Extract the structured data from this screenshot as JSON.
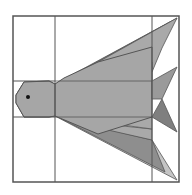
{
  "diagram": {
    "type": "origami-crease-pattern",
    "width": 192,
    "height": 195,
    "colors": {
      "background": "#ffffff",
      "line": "#555555",
      "body": "#a6a6a6",
      "fin_light": "#c4c4c4",
      "fin_mid": "#a9a9a9",
      "fin_dark": "#8e8e8e",
      "tail": "#9a9a9a",
      "tail_dark": "#7f7f7f",
      "eye": "#111111"
    },
    "frame": {
      "x": 13,
      "y": 16,
      "size": 166
    },
    "grid_lines": {
      "vertical": [
        55,
        152
      ],
      "horizontal": [
        81,
        117
      ]
    },
    "body": {
      "points": "16,95 24,82 49,81 55,84 64,78 98,62 152,47 152,117 98,134 55,116 49,117 24,117 16,103"
    },
    "head": {
      "points": "16,95 24,82 49,81 55,84 55,116 49,117 24,117 16,103"
    },
    "eye": {
      "cx": 28,
      "cy": 97,
      "r": 2
    },
    "upper_fins": [
      {
        "name": "upper-fin-outer",
        "points": "55,84 177,18 152,52",
        "fill": "fin_light"
      },
      {
        "name": "upper-fin-dark",
        "points": "60,82 170,22 152,62",
        "fill": "fin_dark"
      },
      {
        "name": "upper-fin-mid",
        "points": "64,81 152,62 152,72 162,48 177,18",
        "fill": "fin_mid"
      },
      {
        "name": "upper-fin-inner",
        "points": "55,84 152,72 152,81",
        "fill": "fin_light"
      }
    ],
    "lower_fins": [
      {
        "name": "lower-fin-outer",
        "points": "55,116 177,180 152,140",
        "fill": "fin_light"
      },
      {
        "name": "lower-fin-dark",
        "points": "60,118 152,140 165,172",
        "fill": "fin_dark"
      },
      {
        "name": "lower-fin-mid",
        "points": "64,120 152,129 152,140",
        "fill": "fin_mid"
      },
      {
        "name": "lower-fin-inner",
        "points": "55,116 152,117 152,129",
        "fill": "fin_mid"
      }
    ],
    "tail": [
      {
        "name": "tail-upper",
        "points": "152,81 177,67 162,99 152,99",
        "fill": "tail"
      },
      {
        "name": "tail-lower",
        "points": "152,117 162,99 177,132",
        "fill": "tail_dark"
      }
    ]
  }
}
